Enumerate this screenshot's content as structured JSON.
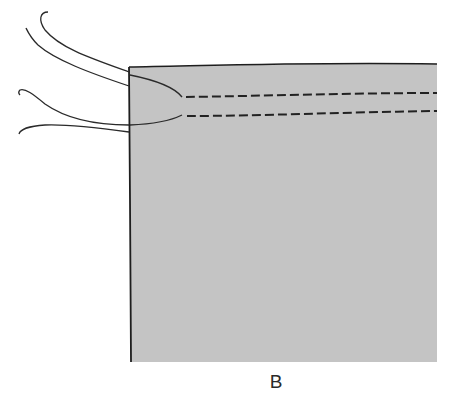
{
  "figure": {
    "label": "B",
    "colors": {
      "fabric_fill": "#c4c4c4",
      "outline": "#1e1e1e",
      "thread": "#2a2a2a",
      "background": "#ffffff"
    },
    "stitch_rows": [
      {
        "name": "upper-basting-row",
        "style": "dashed"
      },
      {
        "name": "lower-basting-row",
        "style": "dashed"
      }
    ],
    "loose_thread_count": 4
  }
}
